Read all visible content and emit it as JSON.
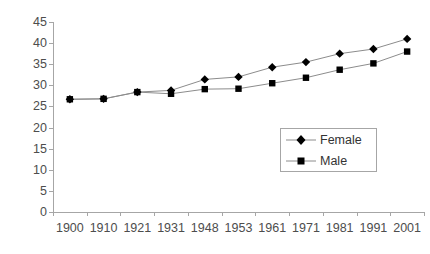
{
  "chart_data": {
    "type": "line",
    "title": "",
    "subtitle": "",
    "xlabel": "",
    "ylabel": "",
    "categories": [
      "1900",
      "1910",
      "1921",
      "1931",
      "1948",
      "1953",
      "1961",
      "1971",
      "1981",
      "1991",
      "2001"
    ],
    "series": [
      {
        "name": "Female",
        "marker": "diamond",
        "color": "#000000",
        "line_color": "#8c8c8c",
        "values": [
          26.7,
          26.8,
          28.4,
          28.8,
          31.4,
          32.0,
          34.3,
          35.5,
          37.5,
          38.6,
          41.0
        ]
      },
      {
        "name": "Male",
        "marker": "square",
        "color": "#000000",
        "line_color": "#8c8c8c",
        "values": [
          26.7,
          26.8,
          28.4,
          28.0,
          29.1,
          29.2,
          30.5,
          31.8,
          33.7,
          35.2,
          38.0
        ]
      }
    ],
    "ylim": [
      0,
      45
    ],
    "ytick_step": 5,
    "yticks": [
      0,
      5,
      10,
      15,
      20,
      25,
      30,
      35,
      40,
      45
    ],
    "ytick_labels": [
      "0",
      "5",
      "10",
      "15",
      "20",
      "25",
      "30",
      "35",
      "40",
      "45"
    ],
    "grid": false,
    "legend_position": "inside-right-middle",
    "axis_color": "#a6a6a6",
    "tick_label_color": "#4d4d4d"
  },
  "legend": {
    "entries": [
      {
        "label": "Female",
        "marker": "diamond"
      },
      {
        "label": "Male",
        "marker": "square"
      }
    ]
  }
}
